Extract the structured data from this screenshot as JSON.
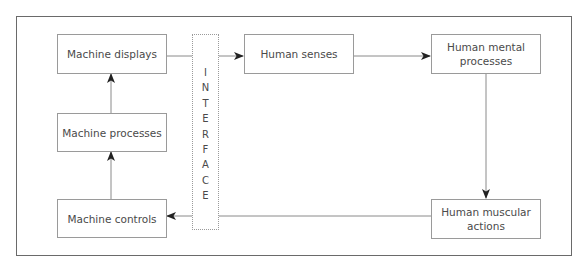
{
  "diagram": {
    "type": "flow",
    "nodes": {
      "machine_displays": "Machine displays",
      "machine_processes": "Machine processes",
      "machine_controls": "Machine controls",
      "human_senses": "Human senses",
      "human_mental_processes_l1": "Human mental",
      "human_mental_processes_l2": "processes",
      "human_muscular_actions_l1": "Human muscular",
      "human_muscular_actions_l2": "actions"
    },
    "interface": {
      "label": "INTERFACE",
      "letters": [
        "I",
        "N",
        "T",
        "E",
        "R",
        "F",
        "A",
        "C",
        "E"
      ]
    },
    "edges": [
      {
        "from": "Machine displays",
        "to": "Human senses"
      },
      {
        "from": "Human senses",
        "to": "Human mental processes"
      },
      {
        "from": "Human mental processes",
        "to": "Human muscular actions"
      },
      {
        "from": "Human muscular actions",
        "to": "Machine controls"
      },
      {
        "from": "Machine controls",
        "to": "Machine processes"
      },
      {
        "from": "Machine processes",
        "to": "Machine displays"
      }
    ],
    "colors": {
      "frame": "#6a6a6a",
      "box_border": "#9a9a9a",
      "line": "#8a8a8a",
      "arrowhead": "#222222",
      "text": "#4a4a4a"
    }
  }
}
